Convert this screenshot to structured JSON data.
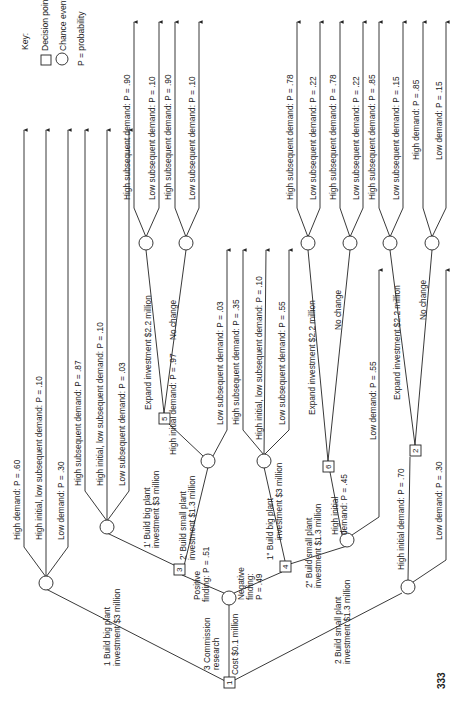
{
  "key": {
    "title": "Key:",
    "decision": "Decision point",
    "chance": "Chance event",
    "prob": "P = probability"
  },
  "page_number": "333",
  "root": {
    "id": "1",
    "type": "decision"
  },
  "branches": {
    "b1": "1 Build big plant",
    "b1b": "investment $3 million",
    "b2": "2 Build small plant",
    "b2b": "investment $1.3 million",
    "b3": "3 Commission",
    "b3b": "research",
    "b3c": "Cost $0.1 million",
    "pos": "Positive",
    "posb": "finding:  P = .51",
    "neg": "Negative",
    "negb": "finding:",
    "negc": "P = .49",
    "b1p": "1' Build big plant",
    "b1pb": "investment $3 million",
    "b2p": "2' Build small plant",
    "b2pb": "investment $1.3 million",
    "b1pp": "1\" Build big plant",
    "b1ppb": "investment $3 million",
    "b2pp": "2\" Build small plant",
    "b2ppb": "investment $1.3 million",
    "hi97": "High initial demand:  P = .97",
    "lo03": "Low subsequent demand:  P = .03",
    "hi45a": "High initial",
    "hi45b": "demand:  P = .45",
    "lo55": "Low demand:  P = .55",
    "hi70": "High initial demand:  P = .70",
    "lo30": "Low demand:  P = .30",
    "expand": "Expand investment $2.2 million",
    "nochange": "No change"
  },
  "decision_nodes": [
    "1",
    "2",
    "3",
    "4",
    "5",
    "6"
  ],
  "leaves": {
    "n1": [
      "High demand:  P = .60",
      "High initial, low subsequent demand:  P = .10",
      "Low demand:  P = .30"
    ],
    "n1p": [
      "High subsequent demand:  P = .87",
      "High initial, low subsequent demand:  P = .10",
      "Low subsequent demand:  P = .03"
    ],
    "n5e": [
      "High subsequent demand:  P = .90",
      "Low subsequent demand:  P = .10"
    ],
    "n5n": [
      "High subsequent demand:  P = .90",
      "Low subsequent demand:  P = .10"
    ],
    "n1pp": [
      "High subsequent demand:  P = .35",
      "High initial, low subsequent demand:  P = .10",
      "Low subsequent demand:  P = .55"
    ],
    "n6e": [
      "High subsequent demand:  P = .78",
      "Low subsequent demand:  P = .22"
    ],
    "n6n": [
      "High subsequent demand:  P = .78",
      "Low subsequent demand:  P = .22"
    ],
    "n2e": [
      "High subsequent demand:  P = .85",
      "Low subsequent demand:  P = .15"
    ],
    "n2n": [
      "High demand:  P = .85",
      "Low demand:  P = .15"
    ]
  }
}
